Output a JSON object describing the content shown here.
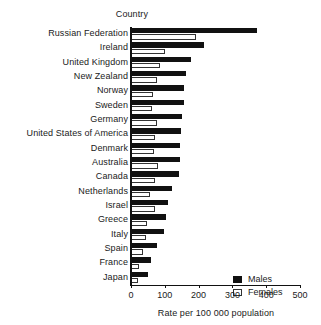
{
  "header": {
    "category_axis_title": "Country"
  },
  "legend": {
    "position": "bottom-right",
    "items": [
      {
        "label": "Males",
        "swatch": "filled-black-square-icon",
        "color": "#111111"
      },
      {
        "label": "Females",
        "swatch": "open-white-square-icon",
        "color": "#ffffff"
      }
    ]
  },
  "chart_data": {
    "type": "bar",
    "orientation": "horizontal",
    "title": "",
    "subtitle": "",
    "xlabel": "Rate per 100 000 population",
    "ylabel": "Country",
    "xlim": [
      0,
      500
    ],
    "xticks": [
      0,
      100,
      200,
      300,
      400,
      500
    ],
    "grid": false,
    "categories": [
      "Russian Federation",
      "Ireland",
      "United Kingdom",
      "New Zealand",
      "Norway",
      "Sweden",
      "Germany",
      "United States of America",
      "Denmark",
      "Australia",
      "Canada",
      "Netherlands",
      "Israel",
      "Greece",
      "Italy",
      "Spain",
      "France",
      "Japan"
    ],
    "series": [
      {
        "name": "Males",
        "color": "#111111",
        "values": [
          373,
          216,
          178,
          163,
          158,
          156,
          152,
          148,
          146,
          145,
          143,
          120,
          110,
          105,
          98,
          78,
          60,
          50
        ]
      },
      {
        "name": "Females",
        "color": "#ffffff",
        "values": [
          192,
          100,
          85,
          76,
          65,
          62,
          77,
          72,
          68,
          80,
          70,
          56,
          72,
          47,
          45,
          36,
          25,
          22
        ]
      }
    ]
  }
}
